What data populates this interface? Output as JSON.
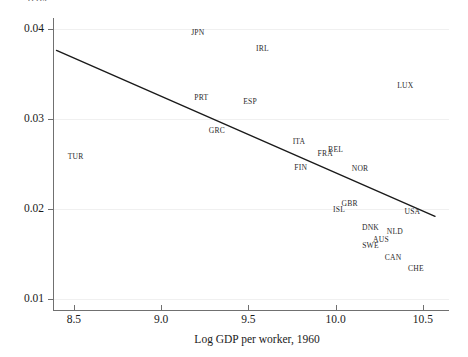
{
  "chart_data": {
    "type": "scatter",
    "title": "",
    "subtitle": "",
    "xlabel": "Log GDP per worker, 1960",
    "ylabel": "",
    "xlim": [
      8.38,
      10.65
    ],
    "ylim": [
      0.0088,
      0.0412
    ],
    "xticks": [
      8.5,
      9.0,
      9.5,
      10.0,
      10.5
    ],
    "xtick_labels": [
      "8.5",
      "9.0",
      "9.5",
      "10.0",
      "10.5"
    ],
    "yticks": [
      0.01,
      0.02,
      0.03,
      0.04
    ],
    "ytick_labels": [
      "0.01",
      "0.02",
      "0.03",
      "0.04"
    ],
    "grid": true,
    "legend": "none",
    "truncated_top_text": "0.04",
    "points": [
      {
        "label": "JPN",
        "x": 9.21,
        "y": 0.0395
      },
      {
        "label": "IRL",
        "x": 9.58,
        "y": 0.0378
      },
      {
        "label": "LUX",
        "x": 10.4,
        "y": 0.0336
      },
      {
        "label": "PRT",
        "x": 9.23,
        "y": 0.0323
      },
      {
        "label": "ESP",
        "x": 9.51,
        "y": 0.0319
      },
      {
        "label": "GRC",
        "x": 9.32,
        "y": 0.0287
      },
      {
        "label": "ITA",
        "x": 9.79,
        "y": 0.0274
      },
      {
        "label": "BEL",
        "x": 10.0,
        "y": 0.0266
      },
      {
        "label": "FRA",
        "x": 9.94,
        "y": 0.0261
      },
      {
        "label": "TUR",
        "x": 8.51,
        "y": 0.0258
      },
      {
        "label": "FIN",
        "x": 9.8,
        "y": 0.0246
      },
      {
        "label": "NOR",
        "x": 10.14,
        "y": 0.0245
      },
      {
        "label": "GBR",
        "x": 10.08,
        "y": 0.0206
      },
      {
        "label": "ISL",
        "x": 10.02,
        "y": 0.0199
      },
      {
        "label": "USA",
        "x": 10.44,
        "y": 0.0197
      },
      {
        "label": "DNK",
        "x": 10.2,
        "y": 0.0179
      },
      {
        "label": "NLD",
        "x": 10.34,
        "y": 0.0175
      },
      {
        "label": "AUS",
        "x": 10.26,
        "y": 0.0166
      },
      {
        "label": "SWE",
        "x": 10.2,
        "y": 0.0159
      },
      {
        "label": "CAN",
        "x": 10.33,
        "y": 0.0146
      },
      {
        "label": "CHE",
        "x": 10.46,
        "y": 0.0133
      }
    ],
    "fit_line": {
      "x_start": 8.4,
      "y_start": 0.0376,
      "x_end": 10.57,
      "y_end": 0.0192,
      "color": "#1a1a1a",
      "width": 1.4
    },
    "colors": {
      "background": "#ffffff",
      "grid": "#f0f0f0",
      "axis": "#707070",
      "label_text": "#2b2b2b",
      "tick_text": "#1a1a1a"
    }
  }
}
